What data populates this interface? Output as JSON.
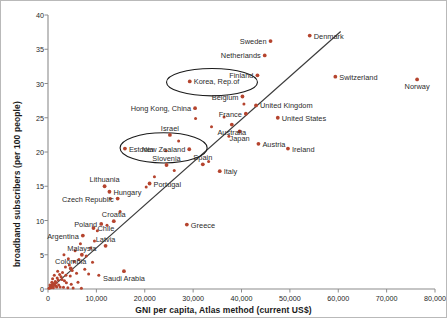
{
  "chart_data": {
    "type": "scatter",
    "title": "",
    "xlabel": "GNI per capita, Atlas method (current US$)",
    "ylabel": "broadband subscribers (per 100 people)",
    "xlim": [
      0,
      80000
    ],
    "ylim": [
      0,
      40
    ],
    "xticks": [
      "0",
      "10,000",
      "20,000",
      "30,000",
      "40,000",
      "50,000",
      "60,000",
      "70,000",
      "80,000"
    ],
    "xtick_values": [
      0,
      10000,
      20000,
      30000,
      40000,
      50000,
      60000,
      70000,
      80000
    ],
    "yticks": [
      "0",
      "5",
      "10",
      "15",
      "20",
      "25",
      "30",
      "35",
      "40"
    ],
    "ytick_values": [
      0,
      5,
      10,
      15,
      20,
      25,
      30,
      35,
      40
    ],
    "grid": false,
    "legend": "none",
    "marker_color": "#b5442e",
    "trendline_color": "#3b3b3b",
    "annotation_color": "#1a1a1a",
    "trendline": {
      "x0": 1200,
      "y0": 0.5,
      "x1": 60500,
      "y1": 37.6
    },
    "annotations": [
      {
        "name": "korea-highlight-ellipse",
        "shape": "ellipse",
        "cx": 33900,
        "cy": 30.2,
        "rx": 9400,
        "ry": 2.0
      },
      {
        "name": "estonia-highlight-ellipse",
        "shape": "ellipse",
        "cx": 23900,
        "cy": 20.6,
        "rx": 9000,
        "ry": 2.2
      }
    ],
    "points": [
      {
        "label": "Denmark",
        "x": 54100,
        "y": 37.0,
        "lp": "left"
      },
      {
        "label": "Sweden",
        "x": 46000,
        "y": 36.2,
        "lp": "right"
      },
      {
        "label": "Netherlands",
        "x": 44800,
        "y": 34.1,
        "lp": "right"
      },
      {
        "label": "Switzerland",
        "x": 59400,
        "y": 31.0,
        "lp": "left"
      },
      {
        "label": "Norway",
        "x": 76300,
        "y": 30.6,
        "lp": "below"
      },
      {
        "label": "Korea, Rep.of",
        "x": 29300,
        "y": 30.3,
        "lp": "left"
      },
      {
        "label": "Finland",
        "x": 43300,
        "y": 31.2,
        "lp": "right"
      },
      {
        "label": "Belgium",
        "x": 40200,
        "y": 28.1,
        "lp": "right"
      },
      {
        "label": "Hong Kong, China",
        "x": 30400,
        "y": 26.4,
        "lp": "right"
      },
      {
        "label": "United Kingdom",
        "x": 43000,
        "y": 26.8,
        "lp": "left"
      },
      {
        "label": "United States",
        "x": 47500,
        "y": 25.0,
        "lp": "left"
      },
      {
        "label": "France",
        "x": 40900,
        "y": 25.6,
        "lp": "right"
      },
      {
        "label": "Australia",
        "x": 38000,
        "y": 24.0,
        "lp": "below"
      },
      {
        "label": "Japan",
        "x": 39600,
        "y": 23.0,
        "lp": "below"
      },
      {
        "label": "Israel",
        "x": 25200,
        "y": 22.5,
        "lp": "above"
      },
      {
        "label": "Austria",
        "x": 43500,
        "y": 21.2,
        "lp": "left"
      },
      {
        "label": "Ireland",
        "x": 49600,
        "y": 20.5,
        "lp": "left"
      },
      {
        "label": "New Zealand",
        "x": 29200,
        "y": 20.4,
        "lp": "right"
      },
      {
        "label": "Estonia",
        "x": 15900,
        "y": 20.5,
        "lp": "left"
      },
      {
        "label": "Slovenia",
        "x": 24500,
        "y": 18.1,
        "lp": "above"
      },
      {
        "label": "Spain",
        "x": 32000,
        "y": 18.2,
        "lp": "above"
      },
      {
        "label": "Italy",
        "x": 35500,
        "y": 17.2,
        "lp": "left"
      },
      {
        "label": "Portugal",
        "x": 21000,
        "y": 15.4,
        "lp": "left"
      },
      {
        "label": "Lithuania",
        "x": 11700,
        "y": 15.0,
        "lp": "above"
      },
      {
        "label": "Hungary",
        "x": 12700,
        "y": 14.2,
        "lp": "left"
      },
      {
        "label": "Czech Republic",
        "x": 14400,
        "y": 13.2,
        "lp": "right"
      },
      {
        "label": "Croatia",
        "x": 13600,
        "y": 9.9,
        "lp": "above"
      },
      {
        "label": "Poland",
        "x": 11000,
        "y": 9.5,
        "lp": "right"
      },
      {
        "label": "Greece",
        "x": 28700,
        "y": 9.4,
        "lp": "left"
      },
      {
        "label": "Chile",
        "x": 9400,
        "y": 8.9,
        "lp": "left"
      },
      {
        "label": "Argentina",
        "x": 7200,
        "y": 7.8,
        "lp": "right"
      },
      {
        "label": "Latvia",
        "x": 11900,
        "y": 6.3,
        "lp": "above"
      },
      {
        "label": "Malaysia",
        "x": 7000,
        "y": 5.0,
        "lp": "above"
      },
      {
        "label": "Colombia",
        "x": 4700,
        "y": 3.0,
        "lp": "above"
      },
      {
        "label": "Saudi Arabia",
        "x": 15700,
        "y": 2.6,
        "lp": "below"
      }
    ],
    "unlabeled_points": [
      {
        "x": 30500,
        "y": 24.9
      },
      {
        "x": 33800,
        "y": 23.7
      },
      {
        "x": 37400,
        "y": 22.3
      },
      {
        "x": 40500,
        "y": 27.0
      },
      {
        "x": 36400,
        "y": 25.1
      },
      {
        "x": 27000,
        "y": 21.6
      },
      {
        "x": 24400,
        "y": 20.2
      },
      {
        "x": 33200,
        "y": 18.6
      },
      {
        "x": 26100,
        "y": 17.3
      },
      {
        "x": 22000,
        "y": 16.4
      },
      {
        "x": 20300,
        "y": 14.9
      },
      {
        "x": 12900,
        "y": 13.2
      },
      {
        "x": 14900,
        "y": 11.3
      },
      {
        "x": 12200,
        "y": 9.3
      },
      {
        "x": 10200,
        "y": 8.5
      },
      {
        "x": 9600,
        "y": 7.0
      },
      {
        "x": 6700,
        "y": 6.6
      },
      {
        "x": 8800,
        "y": 6.0
      },
      {
        "x": 3300,
        "y": 5.0
      },
      {
        "x": 7900,
        "y": 4.8
      },
      {
        "x": 6400,
        "y": 4.3
      },
      {
        "x": 5400,
        "y": 4.0
      },
      {
        "x": 9200,
        "y": 3.9
      },
      {
        "x": 4400,
        "y": 3.5
      },
      {
        "x": 3600,
        "y": 3.2
      },
      {
        "x": 5000,
        "y": 2.7
      },
      {
        "x": 3000,
        "y": 2.4
      },
      {
        "x": 2400,
        "y": 2.1
      },
      {
        "x": 2700,
        "y": 1.8
      },
      {
        "x": 1900,
        "y": 1.6
      },
      {
        "x": 2100,
        "y": 1.3
      },
      {
        "x": 1500,
        "y": 1.1
      },
      {
        "x": 1700,
        "y": 0.9
      },
      {
        "x": 1200,
        "y": 0.8
      },
      {
        "x": 900,
        "y": 0.7
      },
      {
        "x": 1400,
        "y": 0.6
      },
      {
        "x": 700,
        "y": 0.5
      },
      {
        "x": 1000,
        "y": 0.4
      },
      {
        "x": 500,
        "y": 0.35
      },
      {
        "x": 1800,
        "y": 0.3
      },
      {
        "x": 2500,
        "y": 0.28
      },
      {
        "x": 3200,
        "y": 0.25
      },
      {
        "x": 600,
        "y": 0.2
      },
      {
        "x": 1100,
        "y": 0.18
      },
      {
        "x": 300,
        "y": 0.15
      },
      {
        "x": 4100,
        "y": 0.2
      },
      {
        "x": 5200,
        "y": 0.15
      },
      {
        "x": 6900,
        "y": 0.1
      },
      {
        "x": 2200,
        "y": 0.6
      },
      {
        "x": 3800,
        "y": 0.9
      },
      {
        "x": 2900,
        "y": 1.4
      },
      {
        "x": 4600,
        "y": 1.9
      },
      {
        "x": 5900,
        "y": 2.3
      },
      {
        "x": 800,
        "y": 1.0
      },
      {
        "x": 400,
        "y": 0.6
      },
      {
        "x": 1300,
        "y": 2.0
      },
      {
        "x": 2000,
        "y": 2.6
      },
      {
        "x": 200,
        "y": 0.1
      },
      {
        "x": 1600,
        "y": 0.45
      },
      {
        "x": 950,
        "y": 1.5
      },
      {
        "x": 3400,
        "y": 1.2
      },
      {
        "x": 4800,
        "y": 0.7
      },
      {
        "x": 6200,
        "y": 1.0
      },
      {
        "x": 7600,
        "y": 2.9
      },
      {
        "x": 8400,
        "y": 2.2
      },
      {
        "x": 10500,
        "y": 2.0
      },
      {
        "x": 5600,
        "y": 5.6
      },
      {
        "x": 4200,
        "y": 4.4
      },
      {
        "x": 3700,
        "y": 2.0
      }
    ]
  }
}
